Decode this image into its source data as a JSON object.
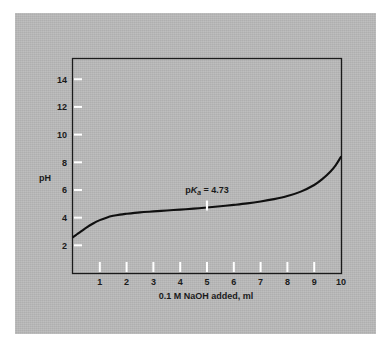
{
  "figure": {
    "background_color": "#ffffff",
    "panel_color": "#b9b9b9",
    "ink_color": "#1a1a1a",
    "marker_color": "#ffffff"
  },
  "chart_data": {
    "type": "line",
    "title": "",
    "subtitle": "",
    "xlabel_parts": {
      "pre": "0.1 ",
      "italic": "M",
      "post": " NaOH added, ml"
    },
    "xlabel": "0.1 M NaOH added, ml",
    "ylabel": "pH",
    "xlim": [
      0,
      10
    ],
    "ylim": [
      0,
      15.5
    ],
    "grid": false,
    "legend": "none",
    "xticks": [
      1,
      2,
      3,
      4,
      5,
      6,
      7,
      8,
      9,
      10
    ],
    "xtick_labels": [
      "1",
      "2",
      "3",
      "4",
      "5",
      "6",
      "7",
      "8",
      "9",
      "10"
    ],
    "yticks": [
      2,
      4,
      6,
      8,
      10,
      12,
      14
    ],
    "ytick_labels": [
      "2",
      "4",
      "6",
      "8",
      "10",
      "12",
      "14"
    ],
    "series": [
      {
        "name": "titration curve",
        "color": "#101010",
        "x": [
          0.0,
          0.15,
          0.3,
          0.5,
          0.75,
          1.0,
          1.25,
          1.5,
          1.75,
          2.0,
          2.5,
          3.0,
          3.5,
          4.0,
          4.5,
          5.0,
          5.5,
          6.0,
          6.5,
          7.0,
          7.5,
          8.0,
          8.5,
          9.0,
          9.3,
          9.6,
          9.8,
          10.0
        ],
        "y": [
          2.6,
          2.8,
          3.0,
          3.28,
          3.58,
          3.82,
          4.0,
          4.13,
          4.22,
          4.28,
          4.38,
          4.45,
          4.52,
          4.58,
          4.65,
          4.73,
          4.82,
          4.92,
          5.03,
          5.17,
          5.34,
          5.56,
          5.88,
          6.36,
          6.78,
          7.32,
          7.78,
          8.4
        ]
      }
    ],
    "annotations": [
      {
        "id": "pka-label",
        "text": "pKa = 4.73",
        "text_parts": {
          "pre": "p",
          "italic": "K",
          "sub": "a",
          "post": "  =  4.73"
        },
        "x": 5.0,
        "y": 5.75,
        "value": 4.73
      }
    ],
    "markers": [
      {
        "id": "pka-tick",
        "kind": "vertical-tick",
        "x": 5.0,
        "y": 4.73,
        "color": "#ffffff"
      }
    ]
  }
}
